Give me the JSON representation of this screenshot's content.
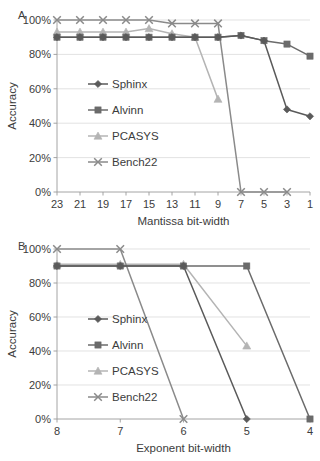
{
  "figure": {
    "background": "#ffffff",
    "panels": [
      {
        "label": "A",
        "chart_ref": 0
      },
      {
        "label": "B",
        "chart_ref": 1
      }
    ]
  },
  "series_style": {
    "Sphinx": {
      "color": "#5a5a5a",
      "marker": "diamond"
    },
    "Alvinn": {
      "color": "#6b6b6b",
      "marker": "square"
    },
    "PCASYS": {
      "color": "#b4b4b4",
      "marker": "triangle"
    },
    "Bench22": {
      "color": "#8a8a8a",
      "marker": "cross"
    }
  },
  "chart_data": [
    {
      "type": "line",
      "panel": "A",
      "title": "",
      "xlabel": "Mantissa bit-width",
      "ylabel": "Accuracy",
      "x": [
        23,
        21,
        19,
        17,
        15,
        13,
        11,
        9,
        7,
        5,
        3,
        1
      ],
      "x_tick_labels": [
        "23",
        "21",
        "19",
        "17",
        "15",
        "13",
        "11",
        "9",
        "7",
        "5",
        "3",
        "1"
      ],
      "x_reversed": true,
      "y_tick_labels": [
        "0%",
        "20%",
        "40%",
        "60%",
        "80%",
        "100%"
      ],
      "y_ticks": [
        0,
        20,
        40,
        60,
        80,
        100
      ],
      "ylim": [
        0,
        100
      ],
      "grid": true,
      "legend_position": "inside-left",
      "series": [
        {
          "name": "Sphinx",
          "values": [
            90,
            90,
            90,
            90,
            90,
            90,
            90,
            90,
            91,
            88,
            48,
            44
          ]
        },
        {
          "name": "Alvinn",
          "values": [
            90,
            90,
            90,
            90,
            90,
            90,
            90,
            90,
            91,
            88,
            86,
            79
          ]
        },
        {
          "name": "PCASYS",
          "values": [
            93,
            93,
            93,
            93,
            95,
            92,
            90,
            54,
            null,
            null,
            null,
            null
          ]
        },
        {
          "name": "Bench22",
          "values": [
            100,
            100,
            100,
            100,
            100,
            98,
            98,
            98,
            0,
            0,
            0,
            null
          ]
        }
      ]
    },
    {
      "type": "line",
      "panel": "B",
      "title": "",
      "xlabel": "Exponent bit-width",
      "ylabel": "Accuracy",
      "x": [
        8,
        7,
        6,
        5,
        4
      ],
      "x_tick_labels": [
        "8",
        "7",
        "6",
        "5",
        "4"
      ],
      "x_reversed": true,
      "y_tick_labels": [
        "0%",
        "20%",
        "40%",
        "60%",
        "80%",
        "100%"
      ],
      "y_ticks": [
        0,
        20,
        40,
        60,
        80,
        100
      ],
      "ylim": [
        0,
        100
      ],
      "grid": true,
      "legend_position": "inside-left",
      "series": [
        {
          "name": "Sphinx",
          "values": [
            90,
            90,
            90,
            0,
            null
          ]
        },
        {
          "name": "Alvinn",
          "values": [
            90,
            90,
            90,
            90,
            0
          ]
        },
        {
          "name": "PCASYS",
          "values": [
            91,
            91,
            91,
            43,
            null
          ]
        },
        {
          "name": "Bench22",
          "values": [
            100,
            100,
            0,
            null,
            null
          ]
        }
      ]
    }
  ]
}
